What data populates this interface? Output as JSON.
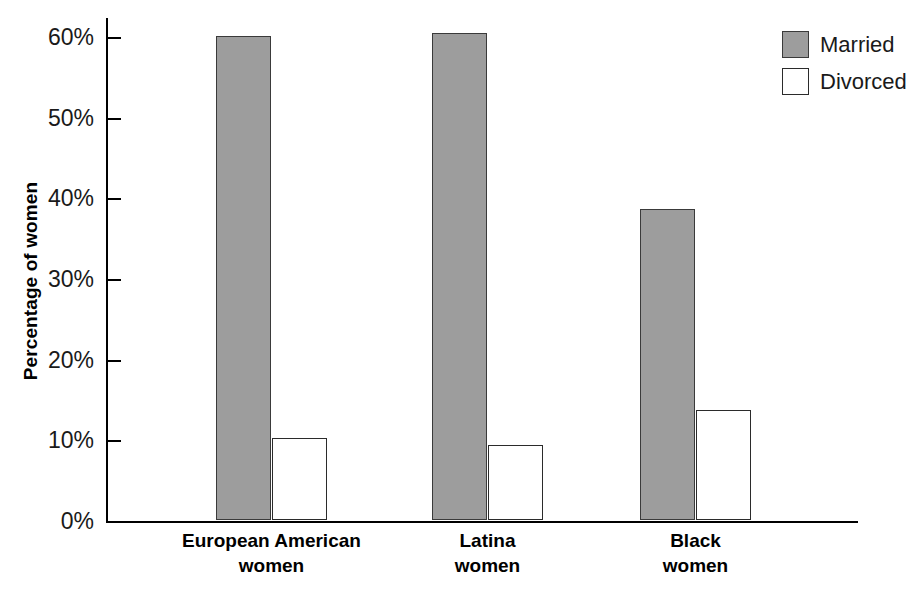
{
  "chart_data": {
    "type": "bar",
    "title": "",
    "subtitle": "",
    "xlabel": "",
    "ylabel": "Percentage of women",
    "ylim": [
      0,
      60
    ],
    "ytick_step": 10,
    "ytick_labels": [
      "0%",
      "10%",
      "20%",
      "30%",
      "40%",
      "50%",
      "60%"
    ],
    "ytick_values": [
      0,
      10,
      20,
      30,
      40,
      50,
      60
    ],
    "grid": false,
    "legend_position": "top-right",
    "categories": [
      "European American women",
      "Latina women",
      "Black women"
    ],
    "category_lines": [
      [
        "European American",
        "women"
      ],
      [
        "Latina",
        "women"
      ],
      [
        "Black",
        "women"
      ]
    ],
    "series": [
      {
        "name": "Married",
        "values": [
          60.0,
          60.4,
          38.6
        ],
        "color": "#9d9d9d"
      },
      {
        "name": "Divorced",
        "values": [
          10.2,
          9.3,
          13.6
        ],
        "color": "#ffffff"
      }
    ]
  },
  "legend": {
    "items": [
      {
        "label": "Married",
        "style": "married"
      },
      {
        "label": "Divorced",
        "style": "divorced"
      }
    ]
  },
  "colors": {
    "married_fill": "#9d9d9d",
    "divorced_fill": "#ffffff",
    "stroke": "#000000",
    "background": "#ffffff"
  }
}
